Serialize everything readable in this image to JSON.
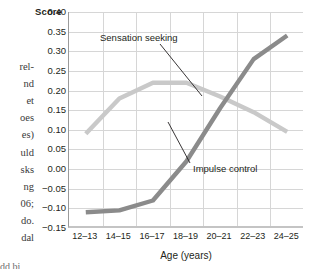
{
  "chart_data": {
    "type": "line",
    "title": "",
    "xlabel": "Age (years)",
    "ylabel": "Score",
    "categories": [
      "12–13",
      "14–15",
      "16–17",
      "18–19",
      "20–21",
      "22–23",
      "24–25"
    ],
    "ylim": [
      -0.15,
      0.4
    ],
    "ytick_values": [
      0.4,
      0.35,
      0.3,
      0.25,
      0.2,
      0.15,
      0.1,
      0.05,
      0.0,
      -0.05,
      -0.1,
      -0.15
    ],
    "ytick_labels": [
      "0.40",
      "0.35",
      "0.30",
      "0.25",
      "0.20",
      "0.15",
      "0.10",
      "0.05",
      "0.00",
      "−0.05",
      "−0.10",
      "−0.15"
    ],
    "grid": true,
    "legend_position": "inline-annotations",
    "series": [
      {
        "name": "Sensation seeking",
        "color": "#c9c9c9",
        "values": [
          0.09,
          0.18,
          0.22,
          0.22,
          0.185,
          0.145,
          0.095
        ]
      },
      {
        "name": "Impulse control",
        "color": "#8b8b8b",
        "values": [
          -0.11,
          -0.105,
          -0.08,
          0.02,
          0.155,
          0.28,
          0.34
        ]
      }
    ],
    "annotations": [
      {
        "text": "Sensation seeking",
        "series": "Sensation seeking"
      },
      {
        "text": "Impulse control",
        "series": "Impulse control"
      }
    ]
  },
  "left_column_fragments": [
    "rel-",
    "nd",
    "et",
    "oes",
    "es)",
    "uld",
    "sks",
    "ng",
    "06;",
    "do.",
    "dal"
  ],
  "bottom_caption_sliver": "dd bi"
}
